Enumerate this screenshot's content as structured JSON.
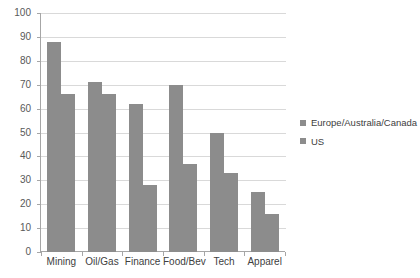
{
  "chart_data": {
    "type": "bar",
    "title": "",
    "xlabel": "",
    "ylabel": "",
    "ylim": [
      0,
      100
    ],
    "yticks": [
      0,
      10,
      20,
      30,
      40,
      50,
      60,
      70,
      80,
      90,
      100
    ],
    "grid": true,
    "legend_position": "right",
    "categories": [
      "Mining",
      "Oil/Gas",
      "Finance",
      "Food/Bev",
      "Tech",
      "Apparel"
    ],
    "series": [
      {
        "name": "Europe/Australia/Canada",
        "color": "#8c8c8c",
        "values": [
          88,
          71,
          62,
          70,
          50,
          25
        ]
      },
      {
        "name": "US",
        "color": "#8c8c8c",
        "values": [
          66,
          66,
          28,
          37,
          33,
          16
        ]
      }
    ]
  },
  "legend": {
    "items": [
      {
        "label": "Europe/Australia/Canada"
      },
      {
        "label": "US"
      }
    ]
  },
  "colors": {
    "bar": "#8c8c8c",
    "gridline": "#d9d9d9",
    "axis": "#a6a6a6",
    "axis_text": "#595959",
    "category_text": "#404040",
    "background": "#ffffff"
  }
}
